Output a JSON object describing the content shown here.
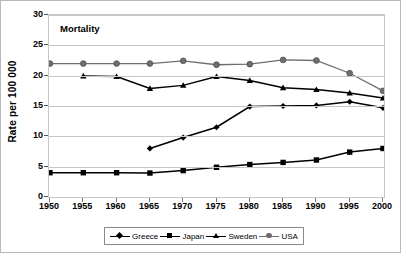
{
  "chart_data": {
    "type": "line",
    "title": "Mortality",
    "xlabel": "",
    "ylabel": "Rate per 100 000",
    "categories": [
      1950,
      1955,
      1960,
      1965,
      1970,
      1975,
      1980,
      1985,
      1990,
      1995,
      2000
    ],
    "xticklabels": [
      "1950",
      "1955",
      "1960",
      "1965",
      "1970",
      "1975",
      "1980",
      "1985",
      "1990",
      "1995",
      "2000"
    ],
    "yticklabels": [
      "0",
      "5",
      "10",
      "15",
      "20",
      "25",
      "30"
    ],
    "yticks": [
      0,
      5,
      10,
      15,
      20,
      25,
      30
    ],
    "ylim": [
      0,
      30
    ],
    "xlim": [
      1950,
      2000
    ],
    "grid": true,
    "legend_position": "bottom",
    "series": [
      {
        "name": "Greece",
        "marker": "diamond",
        "color": "#000000",
        "values": [
          null,
          null,
          null,
          8.0,
          9.8,
          11.5,
          14.9,
          15.0,
          15.1,
          15.7,
          14.7
        ]
      },
      {
        "name": "Japan",
        "marker": "square",
        "color": "#000000",
        "values": [
          4.0,
          4.0,
          4.0,
          3.95,
          4.35,
          4.9,
          5.35,
          5.7,
          6.1,
          7.4,
          8.0
        ]
      },
      {
        "name": "Sweden",
        "marker": "triangle",
        "color": "#000000",
        "values": [
          null,
          19.95,
          19.85,
          17.9,
          18.4,
          19.85,
          19.2,
          18.0,
          17.7,
          17.15,
          16.3
        ]
      },
      {
        "name": "USA",
        "marker": "circle",
        "color": "#6e6e6e",
        "values": [
          22.0,
          22.0,
          22.0,
          22.0,
          22.45,
          21.8,
          21.9,
          22.6,
          22.5,
          20.4,
          17.5
        ]
      }
    ]
  },
  "legend": {
    "items": [
      {
        "label": "Greece"
      },
      {
        "label": "Japan"
      },
      {
        "label": "Sweden"
      },
      {
        "label": "USA"
      }
    ]
  }
}
